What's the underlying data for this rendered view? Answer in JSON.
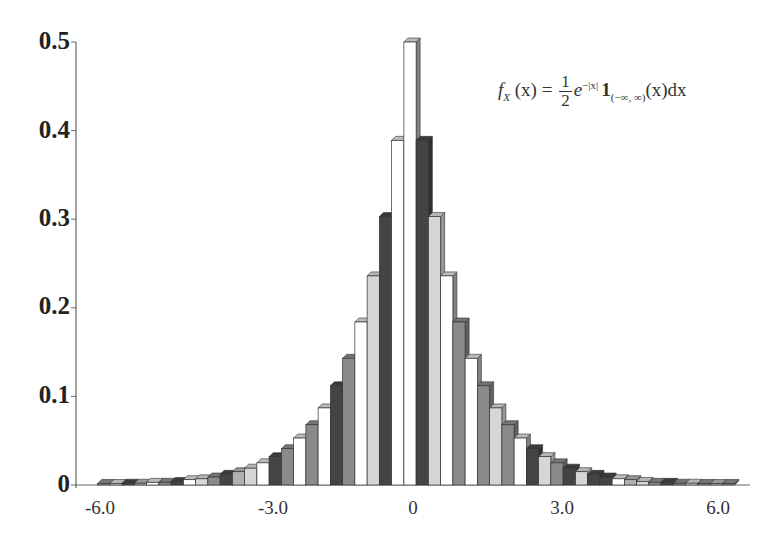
{
  "chart_data": {
    "type": "bar",
    "style": "3d-histogram",
    "title": "",
    "annotation": "f_X(x) = (1/2) e^{-|x|} 1_{(-∞,∞)}(x) dx",
    "xlabel": "",
    "ylabel": "",
    "xlim": [
      -6.5,
      6.5
    ],
    "ylim": [
      0,
      0.5
    ],
    "y_ticks": [
      "0",
      "0.1",
      "0.2",
      "0.3",
      "0.4",
      "0.5"
    ],
    "x_ticks": [
      "-6.0",
      "-3.0",
      "0",
      "3.0",
      "6.0"
    ],
    "x_tick_values": [
      -6,
      -3,
      0,
      3,
      6
    ],
    "grid": false,
    "legend": null,
    "bin_width": 0.25,
    "x": [
      -6.25,
      -6.0,
      -5.75,
      -5.5,
      -5.25,
      -5.0,
      -4.75,
      -4.5,
      -4.25,
      -4.0,
      -3.75,
      -3.5,
      -3.25,
      -3.0,
      -2.75,
      -2.5,
      -2.25,
      -2.0,
      -1.75,
      -1.5,
      -1.25,
      -1.0,
      -0.75,
      -0.5,
      -0.25,
      0,
      0.25,
      0.5,
      0.75,
      1.0,
      1.25,
      1.5,
      1.75,
      2.0,
      2.25,
      2.5,
      2.75,
      3.0,
      3.25,
      3.5,
      3.75,
      4.0,
      4.25,
      4.5,
      4.75,
      5.0,
      5.25,
      5.5,
      5.75,
      6.0,
      6.25,
      6.5
    ],
    "values": [
      0.001,
      0.001,
      0.002,
      0.002,
      0.003,
      0.003,
      0.004,
      0.006,
      0.007,
      0.009,
      0.012,
      0.015,
      0.019,
      0.025,
      0.032,
      0.041,
      0.053,
      0.068,
      0.087,
      0.112,
      0.143,
      0.184,
      0.236,
      0.303,
      0.389,
      0.5,
      0.389,
      0.303,
      0.236,
      0.184,
      0.143,
      0.112,
      0.087,
      0.068,
      0.053,
      0.041,
      0.032,
      0.025,
      0.019,
      0.015,
      0.012,
      0.009,
      0.007,
      0.006,
      0.004,
      0.003,
      0.003,
      0.002,
      0.002,
      0.001,
      0.001,
      0.001
    ],
    "bar_colors": [
      "#8a8a8a",
      "#d6d6d6",
      "#444444",
      "#b0b0b0",
      "#ffffff",
      "#8a8a8a",
      "#444444",
      "#ffffff",
      "#d6d6d6",
      "#8a8a8a",
      "#444444",
      "#b0b0b0",
      "#d6d6d6",
      "#ffffff",
      "#444444",
      "#8a8a8a",
      "#ffffff",
      "#8a8a8a",
      "#ffffff",
      "#444444",
      "#8a8a8a",
      "#ffffff",
      "#d6d6d6",
      "#444444",
      "#ffffff",
      "#ffffff",
      "#444444",
      "#d6d6d6",
      "#ffffff",
      "#8a8a8a",
      "#ffffff",
      "#8a8a8a",
      "#d6d6d6",
      "#8a8a8a",
      "#ffffff",
      "#444444",
      "#d6d6d6",
      "#8a8a8a",
      "#444444",
      "#d6d6d6",
      "#444444",
      "#444444",
      "#ffffff",
      "#b0b0b0",
      "#d6d6d6",
      "#8a8a8a",
      "#444444",
      "#8a8a8a",
      "#d6d6d6",
      "#8a8a8a",
      "#b0b0b0",
      "#8a8a8a"
    ]
  },
  "equation": {
    "lhs_f": "f",
    "lhs_sub": "X",
    "lhs_arg": " (x) = ",
    "frac_num": "1",
    "frac_den": "2",
    "exp_base": "e",
    "exp_sup": "−|x|",
    "indicator": "1",
    "indicator_sub": "(−∞, ∞)",
    "tail": "(x)dx"
  }
}
